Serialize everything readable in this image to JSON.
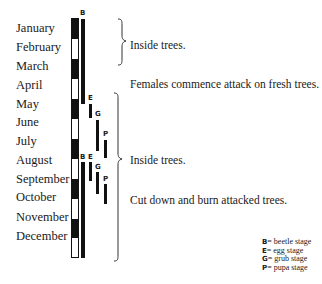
{
  "months": [
    "January",
    "February",
    "March",
    "April",
    "May",
    "June",
    "July",
    "August",
    "September",
    "October",
    "November",
    "December"
  ],
  "calendar_bar": {
    "pattern": [
      "black",
      "white",
      "black",
      "white",
      "black",
      "white",
      "black",
      "white",
      "black",
      "white",
      "black",
      "white"
    ]
  },
  "stages_first_cycle": {
    "B": {
      "label": "B",
      "start": "January",
      "end": "mid-May"
    },
    "E": {
      "label": "E",
      "start": "mid-May",
      "end": "late-May"
    },
    "G": {
      "label": "G",
      "start": "June",
      "end": "July"
    },
    "P": {
      "label": "P",
      "start": "July",
      "end": "August"
    }
  },
  "stages_second_cycle": {
    "B": {
      "label": "B",
      "start": "September",
      "end": "December"
    },
    "E": {
      "label": "E",
      "start": "September",
      "end": "early-October"
    },
    "G": {
      "label": "G",
      "start": "October",
      "end": "late-October"
    },
    "P": {
      "label": "P",
      "start": "October",
      "end": "November"
    }
  },
  "notes": {
    "inside_trees_1": "Inside trees.",
    "females_attack": "Females commence attack on fresh trees.",
    "inside_trees_2": "Inside trees.",
    "cut_burn": "Cut down and burn attacked trees."
  },
  "legend": [
    {
      "key": "B",
      "text": "= beetle stage"
    },
    {
      "key": "E",
      "text": "= egg stage"
    },
    {
      "key": "G",
      "text": "= grub stage"
    },
    {
      "key": "P",
      "text": "= pupa stage"
    }
  ]
}
